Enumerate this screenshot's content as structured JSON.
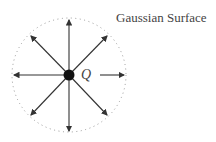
{
  "diagram": {
    "title": "Gaussian Surface",
    "charge_label": "Q",
    "surface": {
      "shape": "circle",
      "style": "dotted",
      "cx": 69,
      "cy": 75,
      "r": 57
    },
    "charge": {
      "cx": 69,
      "cy": 75,
      "r": 5,
      "color": "#111111"
    },
    "field_lines": {
      "count": 8,
      "direction": "outward",
      "color": "#333333"
    }
  }
}
